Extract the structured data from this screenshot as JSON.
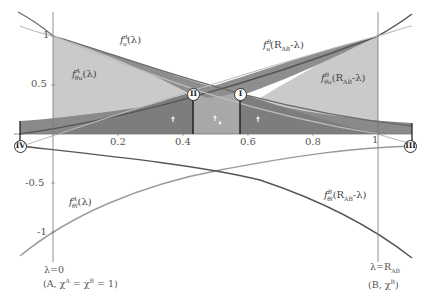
{
  "diagram": {
    "axes": {
      "x_ticks": [
        "0.2",
        "0.4",
        "0.6",
        "0.8",
        "1"
      ],
      "y_ticks": [
        "1",
        "0.5",
        "-0.5",
        "-1"
      ]
    },
    "curve_labels": {
      "fA_u": {
        "f": "f",
        "sup": "A",
        "sub": "u",
        "arg": "(λ)"
      },
      "fA_theta_u": {
        "f": "f",
        "sup": "A",
        "sub": "θ",
        "sub2": "u",
        "arg": "(λ)"
      },
      "fB_u": {
        "f": "f",
        "sup": "B",
        "sub": "u",
        "arg": "(R",
        "argsub": "AB",
        "argend": "-λ)"
      },
      "fB_theta_u": {
        "f": "f",
        "sup": "B",
        "sub": "θ",
        "sub2": "u",
        "arg": "(R",
        "argsub": "AB",
        "argend": "-λ)"
      },
      "fA_theta_l": {
        "f": "f",
        "sup": "A",
        "sub": "θ",
        "sub2": "l",
        "arg": "(λ)"
      },
      "fB_theta_l": {
        "f": "f",
        "sup": "B",
        "sub": "θ",
        "sub2": "l",
        "arg": "(R",
        "argsub": "AB",
        "argend": "-λ)"
      }
    },
    "markers": [
      "II",
      "I",
      "IV",
      "III"
    ],
    "annotations": {
      "left_lambda": "λ=0",
      "left_state": "(A, χ",
      "left_state_supA": "A",
      "left_state_mid": " = χ",
      "left_state_supB": "B",
      "left_state_end": " = 1)",
      "right_lambda": "λ=R",
      "right_lambda_sub": "AB",
      "right_state": "(B, χ",
      "right_state_sup": "B",
      "right_state_end": ")"
    },
    "colors": {
      "light_fill": "#c8c8c8",
      "dark_fill": "#8a8a8a",
      "mid_fill": "#a9a9a9",
      "dark_curve": "#555555",
      "light_curve": "#aaaaaa",
      "axis": "#777777"
    }
  }
}
